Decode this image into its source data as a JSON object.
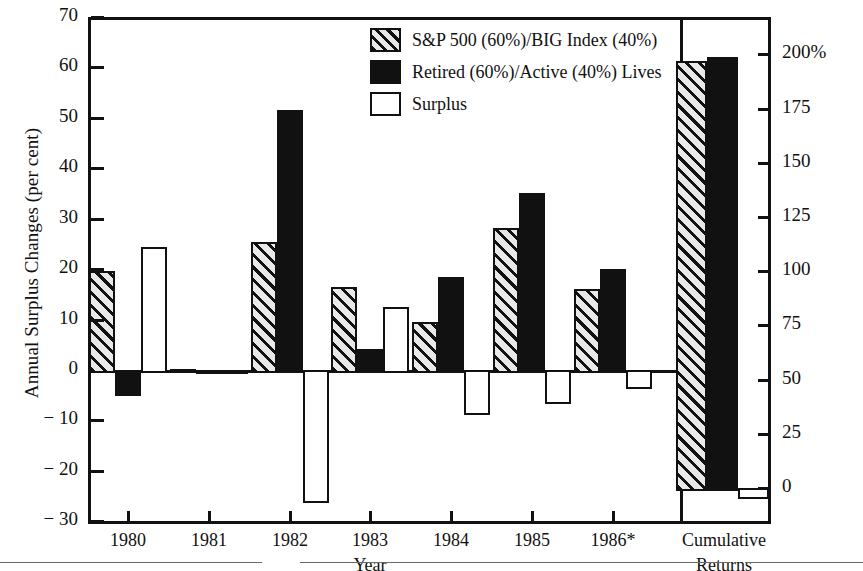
{
  "chart_data": {
    "type": "bar",
    "title": "",
    "subtitle": "",
    "xlabel": "Year",
    "ylabel": "Annual Surplus Changes (per cent)",
    "ylabel_right": "",
    "grid": false,
    "legend_position": "top-center-right",
    "ylim": [
      -30,
      70
    ],
    "ylim_right": [
      0,
      200
    ],
    "yticks": [
      "70",
      "60",
      "50",
      "40",
      "30",
      "20",
      "10",
      "0",
      "− 10",
      "− 20",
      "− 30"
    ],
    "ytick_values": [
      70,
      60,
      50,
      40,
      30,
      20,
      10,
      0,
      -10,
      -20,
      -30
    ],
    "yticks_right": [
      "200%",
      "175",
      "150",
      "125",
      "100",
      "75",
      "50",
      "25",
      "0"
    ],
    "ytick_right_values": [
      200,
      175,
      150,
      125,
      100,
      75,
      50,
      25,
      0
    ],
    "categories": [
      "1980",
      "1981",
      "1982",
      "1983",
      "1984",
      "1985",
      "1986*",
      "Cumulative Returns"
    ],
    "series": [
      {
        "name": "S&P 500 (60%)/BIG Index (40%)",
        "style": "hatched",
        "values": [
          20.2,
          0.0,
          26.0,
          17.0,
          10.2,
          28.7,
          16.7,
          61.2
        ]
      },
      {
        "name": "Retired (60%)/Active (40%) Lives",
        "style": "black",
        "values": [
          -5.2,
          -0.8,
          52.2,
          4.7,
          19.1,
          35.6,
          20.6,
          62.0
        ]
      },
      {
        "name": "Surplus",
        "style": "white",
        "values": [
          25.0,
          -0.3,
          -26.3,
          13.0,
          -9.0,
          -6.7,
          -3.8,
          -24.3
        ]
      }
    ]
  },
  "axes": {
    "left": {
      "title": "Annual Surplus Changes (per cent)",
      "ticks": [
        "70",
        "60",
        "50",
        "40",
        "30",
        "20",
        "10",
        "0",
        "− 10",
        "− 20",
        "− 30"
      ]
    },
    "right": {
      "ticks": [
        "200%",
        "175",
        "150",
        "125",
        "100",
        "75",
        "50",
        "25",
        "0"
      ]
    },
    "bottom": {
      "title": "Year",
      "ticks": [
        "1980",
        "1981",
        "1982",
        "1983",
        "1984",
        "1985",
        "1986*"
      ],
      "right_group_line1": "Cumulative",
      "right_group_line2": "Returns"
    }
  },
  "legend": {
    "items": [
      {
        "label": "S&P 500 (60%)/BIG Index (40%)",
        "swatch": "hatched-swatch"
      },
      {
        "label": "Retired (60%)/Active (40%) Lives",
        "swatch": "black-swatch"
      },
      {
        "label": "Surplus",
        "swatch": "white-swatch"
      }
    ]
  },
  "colors": {
    "ink": "#111111",
    "hatch_fill": "#e8e8e8",
    "solid": "#111111",
    "background": "#ffffff"
  }
}
